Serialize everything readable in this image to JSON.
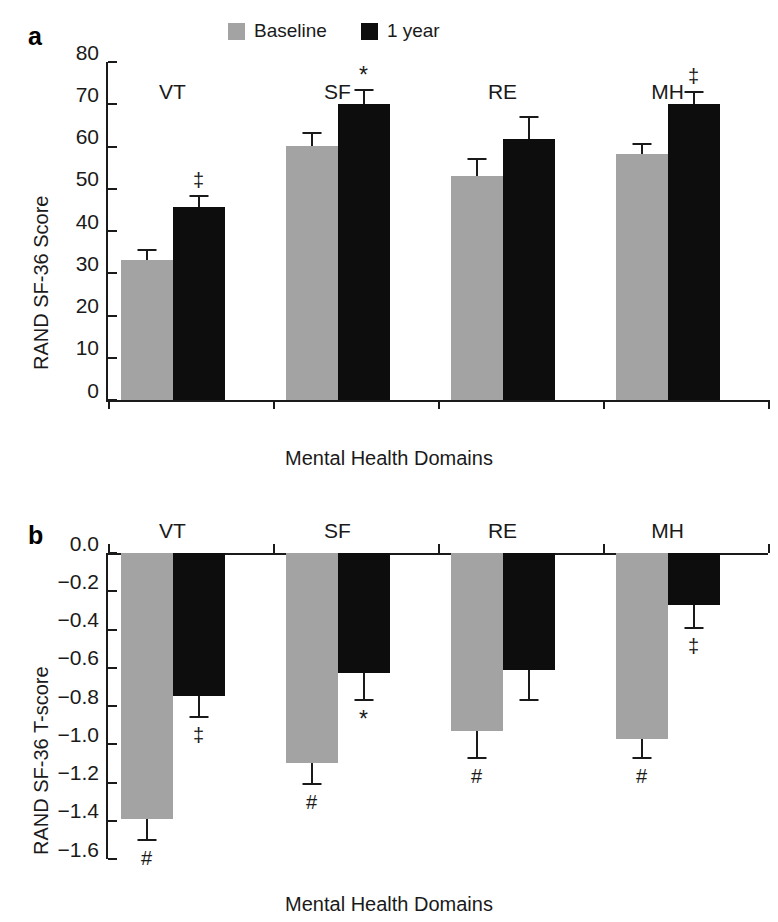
{
  "figure": {
    "panel_a_letter": "a",
    "panel_b_letter": "b"
  },
  "legend": {
    "entries": [
      {
        "label": "Baseline",
        "color": "#a3a3a3"
      },
      {
        "label": "1 year",
        "color": "#0d0d0d"
      }
    ]
  },
  "chart_data": [
    {
      "panel": "a",
      "type": "bar",
      "title": "",
      "xlabel": "Mental Health Domains",
      "ylabel": "RAND SF-36 Score",
      "categories": [
        "VT",
        "SF",
        "RE",
        "MH"
      ],
      "ylim": [
        0,
        80
      ],
      "yticks": [
        "0",
        "10",
        "20",
        "30",
        "40",
        "50",
        "60",
        "70",
        "80"
      ],
      "ytick_values": [
        0,
        10,
        20,
        30,
        40,
        50,
        60,
        70,
        80
      ],
      "grid": false,
      "legend_position": "top-center",
      "series": [
        {
          "name": "Baseline",
          "color": "#a3a3a3",
          "values": [
            33.2,
            60.1,
            52.9,
            58.3
          ],
          "errors": [
            2.4,
            3.0,
            4.1,
            2.2
          ],
          "markers": [
            "",
            "",
            "",
            ""
          ]
        },
        {
          "name": "1 year",
          "color": "#0d0d0d",
          "values": [
            45.7,
            70.1,
            61.7,
            70.0
          ],
          "errors": [
            2.5,
            3.2,
            5.2,
            3.0
          ],
          "markers": [
            "‡",
            "*",
            "",
            "‡"
          ]
        }
      ]
    },
    {
      "panel": "b",
      "type": "bar",
      "title": "",
      "xlabel": "Mental Health Domains",
      "ylabel": "RAND SF-36 T-score",
      "categories": [
        "VT",
        "SF",
        "RE",
        "MH"
      ],
      "ylim": [
        -1.6,
        0.0
      ],
      "yticks": [
        "0.0",
        "−0.2",
        "−0.4",
        "−0.6",
        "−0.8",
        "−1.0",
        "−1.2",
        "−1.4",
        "−1.6"
      ],
      "ytick_values": [
        0.0,
        -0.2,
        -0.4,
        -0.6,
        -0.8,
        -1.0,
        -1.2,
        -1.4,
        -1.6
      ],
      "grid": false,
      "category_labels_position": "top",
      "series": [
        {
          "name": "Baseline",
          "color": "#a3a3a3",
          "values": [
            -1.39,
            -1.1,
            -0.93,
            -0.97
          ],
          "errors": [
            0.11,
            0.11,
            0.14,
            0.1
          ],
          "markers": [
            "#",
            "#",
            "#",
            "#"
          ]
        },
        {
          "name": "1 year",
          "color": "#0d0d0d",
          "values": [
            -0.75,
            -0.63,
            -0.61,
            -0.27
          ],
          "errors": [
            0.11,
            0.14,
            0.16,
            0.12
          ],
          "markers": [
            "‡",
            "*",
            "",
            "‡"
          ]
        }
      ]
    }
  ]
}
